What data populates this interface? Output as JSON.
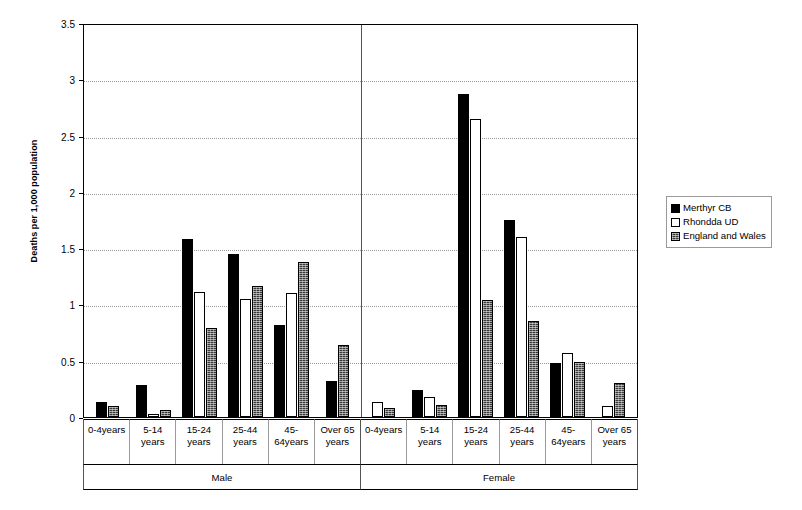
{
  "chart_data": {
    "type": "bar",
    "title": "",
    "xlabel": "",
    "ylabel": "Deaths per 1,000 population",
    "ylim": [
      0,
      3.5
    ],
    "ytick_labels": [
      "0",
      "0.5",
      "1",
      "1.5",
      "2",
      "2.5",
      "3",
      "3.5"
    ],
    "ytick_values": [
      0,
      0.5,
      1,
      1.5,
      2,
      2.5,
      3,
      3.5
    ],
    "grid": true,
    "legend_position": "right",
    "groups": [
      "Male",
      "Female"
    ],
    "categories": [
      "0-4years",
      "5-14 years",
      "15-24 years",
      "25-44 years",
      "45-64years",
      "Over 65 years"
    ],
    "category_lines": [
      [
        "0-4years",
        ""
      ],
      [
        "5-14",
        "years"
      ],
      [
        "15-24",
        "years"
      ],
      [
        "25-44",
        "years"
      ],
      [
        "45-",
        "64years"
      ],
      [
        "Over 65",
        "years"
      ]
    ],
    "series": [
      {
        "name": "Merthyr CB",
        "color": "#000000",
        "fill": "solid-black",
        "male": [
          0.13,
          0.28,
          1.58,
          1.45,
          0.82,
          0.32
        ],
        "female": [
          0.0,
          0.24,
          2.87,
          1.75,
          0.48,
          0.0
        ]
      },
      {
        "name": "Rhondda UD",
        "color": "#ffffff",
        "fill": "hollow-white",
        "male": [
          0.0,
          0.03,
          1.11,
          1.05,
          1.1,
          0.0
        ],
        "female": [
          0.13,
          0.18,
          2.65,
          1.6,
          0.57,
          0.1
        ]
      },
      {
        "name": "England and Wales",
        "color": "#3a3a3a",
        "fill": "hatched-gray",
        "male": [
          0.1,
          0.06,
          0.79,
          1.16,
          1.38,
          0.64
        ],
        "female": [
          0.08,
          0.11,
          1.04,
          0.85,
          0.49,
          0.3
        ]
      }
    ]
  },
  "legend": {
    "items": [
      {
        "label": "Merthyr CB"
      },
      {
        "label": "Rhondda UD"
      },
      {
        "label": "England and Wales"
      }
    ]
  }
}
